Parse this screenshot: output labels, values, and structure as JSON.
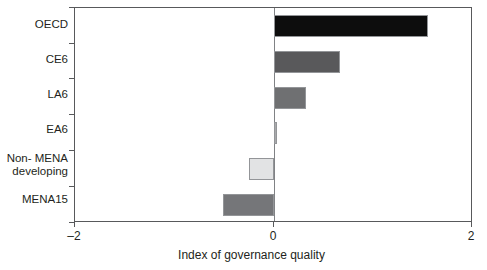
{
  "chart_data": {
    "type": "bar",
    "orientation": "horizontal",
    "title": "",
    "xlabel": "Index of governance quality",
    "ylabel": "",
    "xlim": [
      -2,
      2
    ],
    "xticks": [
      -2,
      0,
      2
    ],
    "xticklabels": [
      "–2",
      "0",
      "2"
    ],
    "grid": false,
    "legend": false,
    "zero_line": true,
    "categories": [
      "OECD",
      "CE6",
      "LA6",
      "EA6",
      "Non- MENA\ndeveloping",
      "MENA15"
    ],
    "values": [
      1.55,
      0.66,
      0.32,
      0.03,
      -0.25,
      -0.51
    ],
    "bar_colors": [
      "#0d0d0d",
      "#59595b",
      "#6f7072",
      "#a9aaac",
      "#e2e3e4",
      "#757679"
    ],
    "bar_edge_color": "#939598",
    "axis_color": "#58595b",
    "zero_line_color": "#808285",
    "text_color": "#231f20",
    "bars": [
      {
        "label": "OECD",
        "value": 1.55,
        "color": "#0d0d0d"
      },
      {
        "label": "CE6",
        "value": 0.66,
        "color": "#59595b"
      },
      {
        "label": "LA6",
        "value": 0.32,
        "color": "#6f7072"
      },
      {
        "label": "EA6",
        "value": 0.03,
        "color": "#a9aaac"
      },
      {
        "label": "Non- MENA\ndeveloping",
        "value": -0.25,
        "color": "#e2e3e4"
      },
      {
        "label": "MENA15",
        "value": -0.51,
        "color": "#757679"
      }
    ]
  }
}
